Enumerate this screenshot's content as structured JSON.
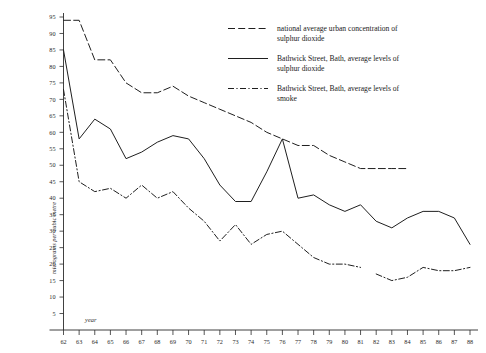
{
  "chart_data": {
    "type": "line",
    "title": "",
    "subtitle": "",
    "xlabel": "year",
    "ylabel": "micrograms per cubic metre",
    "grid": false,
    "legend_position": "top-right",
    "xlim": [
      62,
      88
    ],
    "ylim": [
      0,
      95
    ],
    "x_ticks": [
      62,
      63,
      64,
      65,
      66,
      67,
      68,
      69,
      70,
      71,
      72,
      73,
      74,
      75,
      76,
      77,
      78,
      79,
      80,
      81,
      82,
      83,
      84,
      85,
      86,
      87,
      88
    ],
    "x_tick_labels": [
      "62",
      "63",
      "64",
      "65",
      "66",
      "67",
      "68",
      "69",
      "70",
      "71",
      "72",
      "73",
      "74",
      "75",
      "76",
      "77",
      "78",
      "79",
      "80",
      "81",
      "82",
      "83",
      "84",
      "85",
      "86",
      "87",
      "88"
    ],
    "y_ticks": [
      5,
      10,
      15,
      20,
      25,
      30,
      35,
      40,
      45,
      50,
      55,
      60,
      65,
      70,
      75,
      80,
      85,
      90,
      95
    ],
    "y_tick_labels": [
      "5",
      "10",
      "15",
      "20",
      "25",
      "30",
      "35",
      "40",
      "45",
      "50",
      "55",
      "60",
      "65",
      "70",
      "75",
      "80",
      "85",
      "90",
      "95"
    ],
    "series": [
      {
        "name": "national average urban concentration of sulphur dioxide",
        "key": "national",
        "style": "dashed",
        "x": [
          62,
          63,
          64,
          65,
          66,
          67,
          68,
          69,
          70,
          71,
          72,
          73,
          74,
          75,
          76,
          77,
          78,
          79,
          80,
          81,
          82,
          83,
          84
        ],
        "values": [
          94,
          94,
          82,
          82,
          75,
          72,
          72,
          74,
          71,
          69,
          67,
          65,
          63,
          60,
          58,
          56,
          56,
          53,
          51,
          49,
          49,
          49,
          49
        ]
      },
      {
        "name": "Bathwick Street, Bath, average levels of sulphur dioxide",
        "key": "so2",
        "style": "solid",
        "x": [
          62,
          63,
          64,
          65,
          66,
          67,
          68,
          69,
          70,
          71,
          72,
          73,
          74,
          75,
          76,
          77,
          78,
          79,
          80,
          81,
          82,
          83,
          84,
          85,
          86,
          87,
          88
        ],
        "values": [
          85,
          58,
          64,
          61,
          52,
          54,
          57,
          59,
          58,
          52,
          44,
          39,
          39,
          48,
          58,
          40,
          41,
          38,
          36,
          38,
          33,
          31,
          34,
          36,
          36,
          34,
          26
        ]
      },
      {
        "name": "Bathwick Street, Bath, average levels of smoke",
        "key": "smoke",
        "style": "dash-dot",
        "x": [
          62,
          63,
          64,
          65,
          66,
          67,
          68,
          69,
          70,
          71,
          72,
          73,
          74,
          75,
          76,
          77,
          78,
          79,
          80,
          81,
          82,
          83,
          84,
          85,
          86,
          87,
          88
        ],
        "values": [
          73,
          45,
          42,
          43,
          40,
          44,
          40,
          42,
          37,
          33,
          27,
          32,
          26,
          29,
          30,
          26,
          22,
          20,
          20,
          19,
          17,
          15,
          16,
          19,
          18,
          18,
          19
        ]
      }
    ],
    "smoke_gap_between": [
      81,
      82
    ]
  },
  "legend": {
    "items": [
      {
        "id": "national",
        "line1": "national average urban concentration of",
        "line2": "sulphur dioxide"
      },
      {
        "id": "so2",
        "line1": "Bathwick Street, Bath, average levels of",
        "line2": "sulphur dioxide"
      },
      {
        "id": "smoke",
        "line1": "Bathwick Street, Bath, average levels of",
        "line2": "smoke"
      }
    ]
  },
  "axes": {
    "y_caption": "micrograms per cubic metre",
    "x_caption": "year"
  },
  "colors": {
    "ink": "#1f1f1f",
    "background": "#ffffff"
  }
}
